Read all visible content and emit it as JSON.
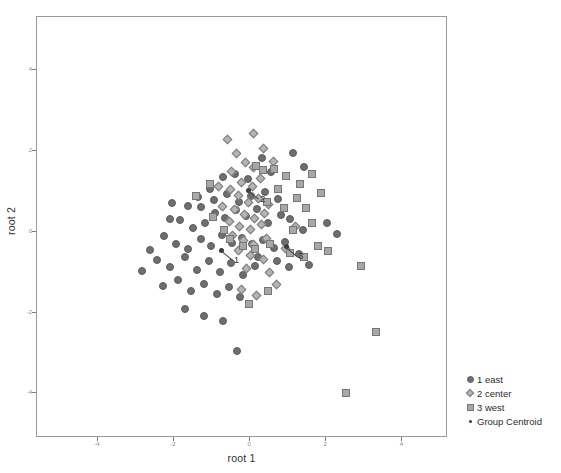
{
  "chart_data": {
    "type": "scatter",
    "title": "",
    "xlabel": "root 1",
    "ylabel": "root 2",
    "xlim": [
      -5.6,
      5.2
    ],
    "ylim": [
      -5.1,
      5.3
    ],
    "xticks": [
      -4,
      -2,
      0,
      2,
      4
    ],
    "yticks": [
      4,
      2,
      0,
      -2,
      -4
    ],
    "grid": false,
    "legend_position": "bottom-right",
    "series": [
      {
        "name": "1 east",
        "marker": "circle",
        "color": "#6e6e6e",
        "points": [
          [
            -1.62,
            0.62
          ],
          [
            -1.28,
            0.6
          ],
          [
            -1.05,
            1.05
          ],
          [
            -0.7,
            1.35
          ],
          [
            -0.4,
            1.42
          ],
          [
            -0.05,
            1.3
          ],
          [
            0.32,
            1.82
          ],
          [
            0.55,
            1.46
          ],
          [
            1.12,
            1.95
          ],
          [
            1.42,
            1.6
          ],
          [
            -2.1,
            0.3
          ],
          [
            -1.85,
            0.28
          ],
          [
            -1.5,
            0.1
          ],
          [
            -1.18,
            0.22
          ],
          [
            -0.92,
            0.45
          ],
          [
            -0.66,
            0.33
          ],
          [
            -0.38,
            0.52
          ],
          [
            -0.12,
            0.38
          ],
          [
            0.18,
            0.55
          ],
          [
            0.46,
            0.2
          ],
          [
            0.8,
            0.42
          ],
          [
            1.05,
            0.3
          ],
          [
            1.38,
            0.05
          ],
          [
            -2.25,
            -0.12
          ],
          [
            -1.95,
            -0.3
          ],
          [
            -1.62,
            -0.42
          ],
          [
            -1.3,
            -0.18
          ],
          [
            -1.02,
            -0.35
          ],
          [
            -0.74,
            -0.08
          ],
          [
            -0.48,
            -0.28
          ],
          [
            -0.22,
            -0.15
          ],
          [
            0.06,
            -0.3
          ],
          [
            0.34,
            -0.22
          ],
          [
            0.62,
            -0.4
          ],
          [
            0.92,
            -0.25
          ],
          [
            1.28,
            -0.55
          ],
          [
            -2.45,
            -0.7
          ],
          [
            -2.1,
            -0.88
          ],
          [
            -1.72,
            -0.62
          ],
          [
            -1.4,
            -0.95
          ],
          [
            -1.08,
            -0.72
          ],
          [
            -0.78,
            -1.0
          ],
          [
            -0.5,
            -0.78
          ],
          [
            -0.18,
            -1.08
          ],
          [
            0.12,
            -0.85
          ],
          [
            -2.3,
            -1.35
          ],
          [
            -1.9,
            -1.2
          ],
          [
            -1.55,
            -1.48
          ],
          [
            -1.2,
            -1.3
          ],
          [
            -0.88,
            -1.55
          ],
          [
            -0.56,
            -1.38
          ],
          [
            -0.26,
            -1.62
          ],
          [
            -1.7,
            -1.92
          ],
          [
            -1.22,
            -2.08
          ],
          [
            -0.72,
            -2.22
          ],
          [
            -0.35,
            -2.95
          ],
          [
            0.22,
            -0.62
          ],
          [
            0.7,
            -0.72
          ],
          [
            1.02,
            -0.88
          ],
          [
            1.55,
            -0.82
          ],
          [
            -0.95,
            0.78
          ],
          [
            -0.6,
            0.92
          ],
          [
            -0.28,
            0.72
          ],
          [
            0.02,
            0.88
          ],
          [
            0.4,
            0.98
          ],
          [
            0.72,
            0.8
          ],
          [
            -1.38,
            0.85
          ],
          [
            2.02,
            0.2
          ],
          [
            2.28,
            -0.05
          ],
          [
            -2.62,
            -0.45
          ],
          [
            -2.85,
            -0.98
          ],
          [
            -2.05,
            0.7
          ]
        ]
      },
      {
        "name": "2 center",
        "marker": "diamond",
        "color": "#b4b4b4",
        "points": [
          [
            -0.6,
            2.28
          ],
          [
            0.1,
            2.42
          ],
          [
            0.35,
            2.05
          ],
          [
            -0.35,
            1.92
          ],
          [
            -0.12,
            1.7
          ],
          [
            0.08,
            1.58
          ],
          [
            -0.48,
            1.48
          ],
          [
            -0.22,
            1.22
          ],
          [
            0.05,
            1.12
          ],
          [
            0.28,
            1.3
          ],
          [
            -0.52,
            1.05
          ],
          [
            -0.3,
            0.88
          ],
          [
            -0.05,
            0.72
          ],
          [
            0.22,
            0.82
          ],
          [
            0.48,
            0.68
          ],
          [
            -0.4,
            0.55
          ],
          [
            -0.15,
            0.42
          ],
          [
            0.12,
            0.32
          ],
          [
            0.38,
            0.45
          ],
          [
            -0.55,
            0.25
          ],
          [
            -0.28,
            0.12
          ],
          [
            0.02,
            0.05
          ],
          [
            0.3,
            0.18
          ],
          [
            -0.45,
            -0.1
          ],
          [
            -0.18,
            -0.22
          ],
          [
            0.1,
            -0.32
          ],
          [
            0.42,
            -0.18
          ],
          [
            -0.3,
            -0.48
          ],
          [
            0.0,
            -0.58
          ],
          [
            0.35,
            -0.7
          ],
          [
            -0.1,
            -0.92
          ],
          [
            0.52,
            -1.02
          ],
          [
            0.7,
            -1.32
          ],
          [
            -0.22,
            -1.42
          ],
          [
            0.18,
            -1.58
          ],
          [
            0.92,
            -0.42
          ],
          [
            1.18,
            0.12
          ],
          [
            -0.72,
            0.62
          ],
          [
            0.62,
            1.72
          ],
          [
            -0.82,
            1.12
          ]
        ]
      },
      {
        "name": "3 west",
        "marker": "square",
        "color": "#a7a7a7",
        "points": [
          [
            -1.42,
            0.88
          ],
          [
            -0.98,
            0.35
          ],
          [
            -0.68,
            0.05
          ],
          [
            0.62,
            1.55
          ],
          [
            0.95,
            1.38
          ],
          [
            1.3,
            1.18
          ],
          [
            1.62,
            1.42
          ],
          [
            1.85,
            0.95
          ],
          [
            1.48,
            0.58
          ],
          [
            0.88,
            0.58
          ],
          [
            0.45,
            0.72
          ],
          [
            0.15,
            1.62
          ],
          [
            0.35,
            1.52
          ],
          [
            -0.52,
            -0.18
          ],
          [
            -0.18,
            -0.35
          ],
          [
            0.12,
            -0.42
          ],
          [
            0.52,
            -0.3
          ],
          [
            1.05,
            -0.52
          ],
          [
            1.42,
            -0.62
          ],
          [
            1.78,
            -0.35
          ],
          [
            2.05,
            -0.48
          ],
          [
            0.48,
            -1.48
          ],
          [
            -0.02,
            -1.78
          ],
          [
            1.12,
            0.05
          ],
          [
            2.92,
            -0.85
          ],
          [
            3.32,
            -2.48
          ],
          [
            2.52,
            -3.98
          ],
          [
            1.62,
            0.22
          ],
          [
            -1.05,
            1.18
          ],
          [
            0.72,
            1.05
          ],
          [
            1.22,
            0.82
          ]
        ]
      }
    ],
    "centroids": [
      {
        "label": "1",
        "x": -0.74,
        "y": -0.48
      },
      {
        "label": "2",
        "x": -0.05,
        "y": 1.02
      },
      {
        "label": "3",
        "x": 0.95,
        "y": -0.38
      }
    ]
  },
  "legend": {
    "entries": [
      {
        "symbol": "circle-marker-icon",
        "label": "1 east"
      },
      {
        "symbol": "diamond-marker-icon",
        "label": "2 center"
      },
      {
        "symbol": "square-marker-icon",
        "label": "3 west"
      },
      {
        "symbol": "dot-marker-icon",
        "label": "Group Centroid"
      }
    ]
  }
}
